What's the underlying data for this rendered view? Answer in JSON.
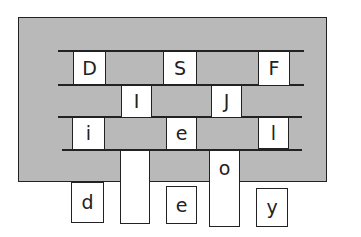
{
  "puzzle": {
    "row1": [
      "D",
      "S",
      "F"
    ],
    "row2": [
      "I",
      "J"
    ],
    "row3": [
      "i",
      "e",
      "l"
    ],
    "column_o": "o",
    "bottom": [
      "d",
      "",
      "e",
      "y"
    ]
  },
  "colors": {
    "board": "#b9b9b9",
    "line": "#222222",
    "tile": "#ffffff"
  }
}
